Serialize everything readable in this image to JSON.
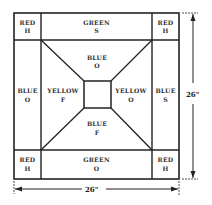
{
  "diagram": {
    "type": "quilt-block-layout",
    "colors": {
      "line": "#222222",
      "text": "#333333",
      "background": "#ffffff"
    },
    "corners": {
      "top_left": {
        "color": "RED",
        "code": "H"
      },
      "top_right": {
        "color": "RED",
        "code": "H"
      },
      "bottom_left": {
        "color": "RED",
        "code": "H"
      },
      "bottom_right": {
        "color": "RED",
        "code": "H"
      }
    },
    "borders": {
      "top": {
        "color": "GREEN",
        "code": "S"
      },
      "bottom": {
        "color": "GREEN",
        "code": "O"
      },
      "left": {
        "color": "BLUE",
        "code": "O"
      },
      "right": {
        "color": "BLUE",
        "code": "S"
      }
    },
    "inner_trapezoids": {
      "top": {
        "color": "BLUE",
        "code": "O"
      },
      "bottom": {
        "color": "BLUE",
        "code": "F"
      },
      "left": {
        "color": "YELLOW",
        "code": "F"
      },
      "right": {
        "color": "YELLOW",
        "code": "O"
      }
    },
    "center_square": {
      "color": "",
      "code": ""
    },
    "dimensions": {
      "height": "26\"",
      "width": "26\""
    }
  }
}
